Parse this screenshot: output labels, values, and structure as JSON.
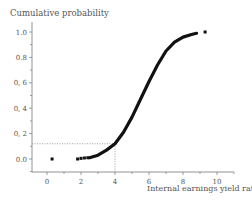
{
  "chart_data": {
    "type": "scatter",
    "title": "",
    "ylabel": "Cumulative probability",
    "xlabel": "Internal earnings yield ratio %",
    "xlim": [
      -1,
      11
    ],
    "ylim": [
      -0.1,
      1.05
    ],
    "x_ticks": [
      0,
      2,
      4,
      6,
      8,
      10
    ],
    "x_tick_labels": [
      "0",
      "2",
      "4",
      "6",
      "8",
      "10"
    ],
    "y_ticks": [
      0.0,
      0.2,
      0.4,
      0.6,
      0.8,
      1.0
    ],
    "y_tick_labels": [
      "0.0",
      "0, 2",
      "0, 4",
      "0, 6",
      "0.8",
      "1.0"
    ],
    "grid": false,
    "legend": null,
    "series": [
      {
        "name": "isolated points",
        "x": [
          0.3,
          1.8,
          2.0,
          2.2,
          2.4,
          9.3
        ],
        "y": [
          0.0,
          0.0,
          0.005,
          0.008,
          0.01,
          1.0
        ]
      },
      {
        "name": "cumulative curve",
        "x": [
          2.5,
          3.0,
          3.5,
          4.0,
          4.5,
          5.0,
          5.5,
          6.0,
          6.5,
          7.0,
          7.5,
          8.0,
          8.5,
          8.8
        ],
        "y": [
          0.01,
          0.03,
          0.07,
          0.12,
          0.21,
          0.33,
          0.47,
          0.61,
          0.74,
          0.85,
          0.92,
          0.96,
          0.98,
          0.99
        ]
      }
    ],
    "annotations": [
      {
        "type": "dotted-reference",
        "x": 4.0,
        "y": 0.12,
        "description": "dotted lines from axes to point (4, 0.12)"
      }
    ]
  }
}
